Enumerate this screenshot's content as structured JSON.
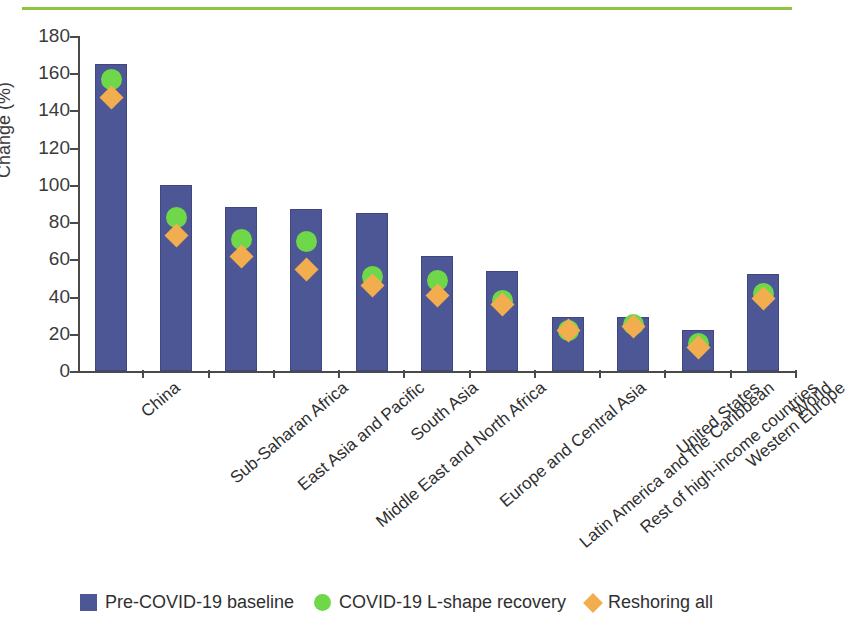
{
  "chart_data": {
    "type": "bar",
    "title": "",
    "xlabel": "",
    "ylabel": "Change (%)",
    "ylim": [
      0,
      180
    ],
    "yticks": [
      0,
      20,
      40,
      60,
      80,
      100,
      120,
      140,
      160,
      180
    ],
    "grid": false,
    "legend_position": "bottom",
    "categories": [
      "China",
      "Sub-Saharan Africa",
      "East Asia and Pacific",
      "Middle East and North Africa",
      "South Asia",
      "Europe and Central Asia",
      "Latin America and the Caribbean",
      "Rest of high-income countries",
      "United States",
      "Western Europe",
      "World"
    ],
    "series": [
      {
        "name": "Pre-COVID-19 baseline",
        "marker": "bar",
        "color": "#4e5795",
        "values": [
          165,
          100,
          88,
          87,
          85,
          62,
          54,
          29,
          29,
          22,
          52
        ]
      },
      {
        "name": "COVID-19 L-shape recovery",
        "marker": "circle",
        "color": "#6ed84a",
        "values": [
          157,
          83,
          71,
          70,
          51,
          49,
          38,
          22,
          25,
          15,
          42
        ]
      },
      {
        "name": "Reshoring all",
        "marker": "diamond",
        "color": "#f2ad4e",
        "values": [
          147,
          73,
          62,
          55,
          46,
          41,
          36,
          22,
          24,
          13,
          39
        ]
      }
    ]
  },
  "decor": {
    "top_rule_color": "#8cc63f"
  }
}
